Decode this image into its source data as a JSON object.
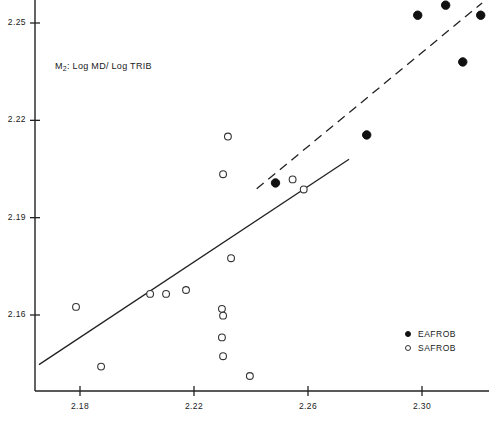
{
  "chart_data": {
    "type": "scatter",
    "title": "",
    "annotation": "M2: Log MD/Log TRIB",
    "annotation_base": "M",
    "annotation_sub": "2",
    "annotation_rest": ": Log MD/ Log TRIB",
    "xlabel": "",
    "ylabel": "",
    "xlim": [
      2.1656,
      2.3268
    ],
    "ylim": [
      2.1447,
      2.2562
    ],
    "xticks": [
      2.18,
      2.22,
      2.26,
      2.3
    ],
    "xtick_labels": [
      "2.18",
      "2.22",
      "2.26",
      "2.30"
    ],
    "yticks": [
      2.16,
      2.19,
      2.22,
      2.25
    ],
    "ytick_labels": [
      "2.16",
      "2.19",
      "2.22",
      "2.25"
    ],
    "grid": false,
    "legend_position": "lower-right",
    "series": [
      {
        "name": "EAFROB",
        "marker": "filled-circle",
        "color": "#111111",
        "points": [
          {
            "x": 2.2486,
            "y": 2.2007
          },
          {
            "x": 2.2806,
            "y": 2.2155
          },
          {
            "x": 2.2985,
            "y": 2.2524
          },
          {
            "x": 2.3083,
            "y": 2.2555
          },
          {
            "x": 2.3206,
            "y": 2.2524
          },
          {
            "x": 2.3143,
            "y": 2.238
          }
        ]
      },
      {
        "name": "SAFROB",
        "marker": "open-circle",
        "color": "#333333",
        "points": [
          {
            "x": 2.1874,
            "y": 2.1441
          },
          {
            "x": 2.1786,
            "y": 2.1625
          },
          {
            "x": 2.2046,
            "y": 2.1665
          },
          {
            "x": 2.2102,
            "y": 2.1665
          },
          {
            "x": 2.2172,
            "y": 2.1677
          },
          {
            "x": 2.2298,
            "y": 2.1531
          },
          {
            "x": 2.2302,
            "y": 2.1473
          },
          {
            "x": 2.2396,
            "y": 2.1412
          },
          {
            "x": 2.2298,
            "y": 2.1619
          },
          {
            "x": 2.2302,
            "y": 2.1598
          },
          {
            "x": 2.233,
            "y": 2.1775
          },
          {
            "x": 2.2319,
            "y": 2.215
          },
          {
            "x": 2.2302,
            "y": 2.2034
          },
          {
            "x": 2.2546,
            "y": 2.2018
          },
          {
            "x": 2.2585,
            "y": 2.1987
          }
        ]
      }
    ],
    "fit_lines": [
      {
        "name": "SAFROB-fit",
        "style": "solid",
        "x0": 2.1656,
        "y0": 2.1447,
        "x1": 2.2744,
        "y1": 2.208
      },
      {
        "name": "EAFROB-fit",
        "style": "dashed",
        "x0": 2.242,
        "y0": 2.1989,
        "x1": 2.3211,
        "y1": 2.2562
      }
    ]
  },
  "legend": {
    "items": [
      {
        "label": "EAFROB",
        "marker": "filled-circle"
      },
      {
        "label": "SAFROB",
        "marker": "open-circle"
      }
    ]
  }
}
